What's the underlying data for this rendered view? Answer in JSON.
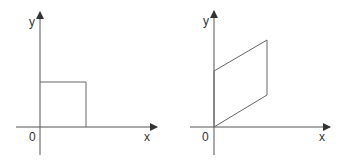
{
  "diagrams": [
    {
      "name": "left",
      "shape": "square",
      "labels": {
        "y": "y",
        "x": "x",
        "origin": "0"
      },
      "origin": [
        40,
        127
      ],
      "points": [
        [
          40,
          127
        ],
        [
          86,
          127
        ],
        [
          86,
          82
        ],
        [
          40,
          82
        ]
      ]
    },
    {
      "name": "right",
      "shape": "parallelogram",
      "labels": {
        "y": "y",
        "x": "x",
        "origin": "0"
      },
      "origin": [
        214,
        127
      ],
      "points": [
        [
          214,
          127
        ],
        [
          267,
          95
        ],
        [
          267,
          40
        ],
        [
          214,
          71
        ]
      ]
    }
  ],
  "colors": {
    "axis": "#444444",
    "shape": "#555555",
    "text": "#333333"
  }
}
